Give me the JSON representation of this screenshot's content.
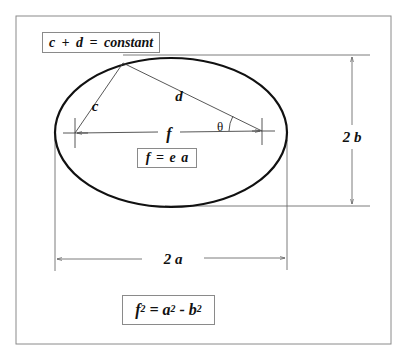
{
  "diagram": {
    "type": "ellipse-geometry",
    "colors": {
      "stroke": "#111111",
      "thin_line": "#6e6e6e",
      "frame": "#8a8a8a",
      "background": "#ffffff"
    },
    "labels": {
      "c": "c",
      "d": "d",
      "f": "f",
      "theta": "θ",
      "two_b": "2 b",
      "two_a": "2 a"
    },
    "equations": {
      "constant_sum": "c + d = constant",
      "focal_distance": "f = e a",
      "relation_f": "f",
      "relation_eq": " = a",
      "relation_minus": " - b",
      "exponent": "2"
    }
  }
}
